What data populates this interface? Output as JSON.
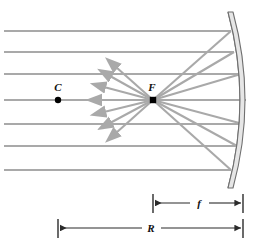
{
  "figure": {
    "type": "optics-ray-diagram",
    "background_color": "#ffffff",
    "ray_color": "#a9a9a9",
    "mirror_fill": "#e6e6e6",
    "mirror_stroke": "#6f6f6f",
    "dimension_color": "#2b2b2b",
    "point_color": "#000000"
  },
  "labels": {
    "center_of_curvature": "C",
    "focal_point": "F",
    "focal_length": "f",
    "radius_of_curvature": "R"
  },
  "points": [
    {
      "name": "center-of-curvature",
      "label": "C",
      "x": 58,
      "y": 100,
      "label_x": 58,
      "label_y": 90
    },
    {
      "name": "focal-point",
      "label": "F",
      "x": 153,
      "y": 100,
      "label_x": 152,
      "label_y": 90
    }
  ],
  "mirror": {
    "name": "concave-mirror",
    "top_x": 228,
    "top_y": 12,
    "bottom_x": 228,
    "bottom_y": 188,
    "vertex_x": 246,
    "vertex_y": 100,
    "thickness": 6
  },
  "incoming_rays": {
    "name": "parallel-incident-rays",
    "count": 7,
    "start_x": 4,
    "y_values": [
      31,
      52,
      74,
      100,
      124,
      146,
      170
    ]
  },
  "reflected_rays": {
    "name": "reflected-rays-through-focus",
    "count": 7,
    "description": "rays converge at focal point F and continue past it with arrowheads"
  },
  "dimensions": [
    {
      "name": "focal-length-dimension",
      "label": "f",
      "x1": 153,
      "x2": 243,
      "y": 203,
      "label_x": 199,
      "label_y": 203
    },
    {
      "name": "radius-dimension",
      "label": "R",
      "x1": 58,
      "x2": 243,
      "y": 228,
      "label_x": 151,
      "label_y": 228
    }
  ]
}
